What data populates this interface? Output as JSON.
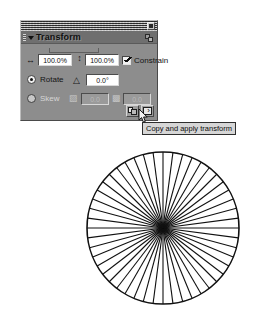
{
  "panel": {
    "title": "Transform",
    "close_icon": "close-box-icon",
    "options_icon": "panel-options-icon",
    "collapse_icon": "triangle-down-icon",
    "grip_icon": "panel-grip-icon",
    "scale": {
      "width_icon": "horizontal-resize-icon",
      "width_value": "100.0%",
      "height_icon": "vertical-resize-icon",
      "height_value": "100.0%",
      "constrain_label": "Constrain",
      "constrain_checked": true
    },
    "rotate": {
      "label": "Rotate",
      "selected": true,
      "angle_icon": "angle-icon",
      "angle_value": "0.0°"
    },
    "skew": {
      "label": "Skew",
      "selected": false,
      "horizontal_icon": "skew-horizontal-icon",
      "horizontal_value": "0.0",
      "vertical_icon": "skew-vertical-icon",
      "vertical_value": "0.0",
      "enabled": false
    },
    "buttons": [
      {
        "name": "copy-and-apply-transform",
        "icon": "copy-apply-transform-icon"
      },
      {
        "name": "apply-transform",
        "icon": "apply-transform-icon"
      }
    ]
  },
  "tooltip": {
    "text": "Copy and apply transform"
  },
  "cursor": {
    "icon": "arrow-pointer-icon"
  },
  "artboard": {
    "shape_name": "radial-burst",
    "spoke_count": 48,
    "center_x": 78,
    "center_y": 78,
    "radius": 76,
    "stroke_color": "#111111",
    "stroke_width": 1.1,
    "outline_stroke_width": 1.6
  },
  "colors": {
    "panel_face": "#8d8d8d",
    "panel_titlebar": "#4d4d4d",
    "field_background": "#ffffff",
    "tooltip_background": "#d6d6d6",
    "ink": "#111111",
    "canvas": "#ffffff"
  }
}
